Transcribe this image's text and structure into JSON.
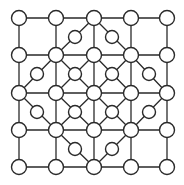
{
  "diagram": {
    "type": "board-game-grid",
    "colors": {
      "line": "#2a2a2a",
      "node_fill": "#ffffff",
      "background": "#ffffff"
    },
    "grid": {
      "xs": [
        19,
        56,
        94,
        131,
        167
      ],
      "ys": [
        18,
        55,
        93,
        130,
        167
      ]
    },
    "main_nodes_radius": 7.5,
    "mid_nodes_radius": 6.5,
    "mid_nodes": [
      [
        75,
        37
      ],
      [
        112,
        37
      ],
      [
        37,
        74
      ],
      [
        75,
        74
      ],
      [
        112,
        74
      ],
      [
        149,
        74
      ],
      [
        37,
        112
      ],
      [
        75,
        112
      ],
      [
        112,
        112
      ],
      [
        149,
        112
      ],
      [
        75,
        149
      ],
      [
        112,
        149
      ]
    ],
    "diagonals": [
      [
        [
          94,
          18
        ],
        [
          56,
          55
        ]
      ],
      [
        [
          94,
          18
        ],
        [
          131,
          55
        ]
      ],
      [
        [
          56,
          55
        ],
        [
          19,
          93
        ]
      ],
      [
        [
          131,
          55
        ],
        [
          167,
          93
        ]
      ],
      [
        [
          19,
          93
        ],
        [
          56,
          130
        ]
      ],
      [
        [
          167,
          93
        ],
        [
          131,
          130
        ]
      ],
      [
        [
          56,
          130
        ],
        [
          94,
          167
        ]
      ],
      [
        [
          131,
          130
        ],
        [
          94,
          167
        ]
      ],
      [
        [
          56,
          55
        ],
        [
          94,
          93
        ]
      ],
      [
        [
          131,
          55
        ],
        [
          94,
          93
        ]
      ],
      [
        [
          56,
          130
        ],
        [
          94,
          93
        ]
      ],
      [
        [
          131,
          130
        ],
        [
          94,
          93
        ]
      ],
      [
        [
          94,
          18
        ],
        [
          94,
          93
        ]
      ],
      [
        [
          56,
          55
        ],
        [
          56,
          130
        ]
      ],
      [
        [
          131,
          55
        ],
        [
          131,
          130
        ]
      ],
      [
        [
          56,
          55
        ],
        [
          19,
          93
        ]
      ],
      [
        [
          94,
          55
        ],
        [
          75,
          74
        ]
      ],
      [
        [
          94,
          55
        ],
        [
          112,
          74
        ]
      ],
      [
        [
          56,
          93
        ],
        [
          37,
          74
        ]
      ],
      [
        [
          56,
          93
        ],
        [
          37,
          112
        ]
      ],
      [
        [
          131,
          93
        ],
        [
          149,
          74
        ]
      ],
      [
        [
          131,
          93
        ],
        [
          149,
          112
        ]
      ],
      [
        [
          94,
          130
        ],
        [
          75,
          112
        ]
      ],
      [
        [
          94,
          130
        ],
        [
          112,
          112
        ]
      ]
    ]
  }
}
